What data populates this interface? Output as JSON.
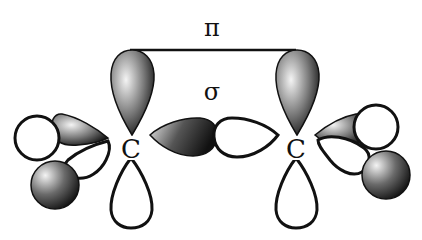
{
  "diagram": {
    "labels": {
      "pi": "π",
      "sigma": "σ",
      "carbon_left": "C",
      "carbon_right": "C"
    },
    "colors": {
      "stroke": "#111111",
      "shaded_dark": "#111111",
      "shaded_light": "#f2f2f2",
      "background": "#ffffff"
    }
  }
}
